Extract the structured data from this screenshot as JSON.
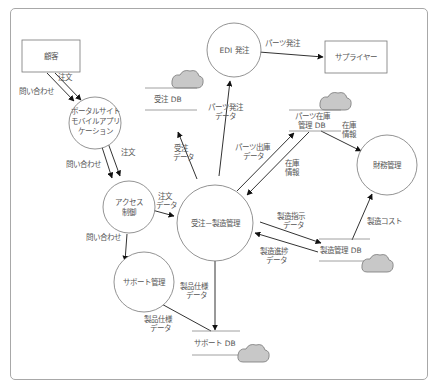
{
  "diagram": {
    "type": "data-flow-diagram",
    "colors": {
      "line": "#333333",
      "node_border": "#777777",
      "cloud_fill": "#c8c8c8",
      "frame": "#a8a8a8",
      "text": "#555555"
    },
    "externals": [
      {
        "id": "customer",
        "label": "顧客"
      },
      {
        "id": "supplier",
        "label": "サプライヤー"
      }
    ],
    "processes": [
      {
        "id": "portal",
        "lines": [
          "ポータルサイト",
          "モバイルアプリ",
          "ケーション"
        ]
      },
      {
        "id": "access",
        "lines": [
          "アクセス",
          "制御"
        ]
      },
      {
        "id": "edi",
        "lines": [
          "EDI 発注"
        ]
      },
      {
        "id": "order_mfg",
        "lines": [
          "受注－製造管理"
        ]
      },
      {
        "id": "finance",
        "lines": [
          "財務管理"
        ]
      },
      {
        "id": "support",
        "lines": [
          "サポート管理"
        ]
      }
    ],
    "stores": [
      {
        "id": "order_db",
        "lines": [
          "受注 DB"
        ]
      },
      {
        "id": "parts_db",
        "lines": [
          "パーツ在庫",
          "管理 DB"
        ]
      },
      {
        "id": "mfg_db",
        "lines": [
          "製造管理 DB"
        ]
      },
      {
        "id": "support_db",
        "lines": [
          "サポート DB"
        ]
      }
    ],
    "flows": [
      {
        "from": "customer",
        "to": "portal",
        "label": [
          "注文"
        ]
      },
      {
        "from": "customer",
        "to": "portal",
        "label": [
          "問い合わせ"
        ]
      },
      {
        "from": "portal",
        "to": "access",
        "label": [
          "注文"
        ]
      },
      {
        "from": "portal",
        "to": "access",
        "label": [
          "問い合わせ"
        ]
      },
      {
        "from": "access",
        "to": "order_mfg",
        "label": [
          "注文",
          "データ"
        ]
      },
      {
        "from": "access",
        "to": "support",
        "label": [
          "問い合わせ"
        ]
      },
      {
        "from": "order_mfg",
        "to": "order_db",
        "label": [
          "受注",
          "データ"
        ]
      },
      {
        "from": "order_mfg",
        "to": "edi",
        "label": [
          "パーツ発注",
          "データ"
        ]
      },
      {
        "from": "edi",
        "to": "supplier",
        "label": [
          "パーツ発注"
        ]
      },
      {
        "from": "order_mfg",
        "to": "parts_db",
        "label": [
          "パーツ出庫",
          "データ"
        ]
      },
      {
        "from": "parts_db",
        "to": "order_mfg",
        "label": [
          "在庫",
          "情報"
        ]
      },
      {
        "from": "parts_db",
        "to": "finance",
        "label": [
          "在庫",
          "情報"
        ]
      },
      {
        "from": "order_mfg",
        "to": "mfg_db",
        "label": [
          "製造指示",
          "データ"
        ]
      },
      {
        "from": "mfg_db",
        "to": "order_mfg",
        "label": [
          "製造進捗",
          "データ"
        ]
      },
      {
        "from": "mfg_db",
        "to": "finance",
        "label": [
          "製造コスト"
        ]
      },
      {
        "from": "order_mfg",
        "to": "support_db",
        "label": [
          "製品仕様",
          "データ"
        ]
      },
      {
        "from": "support_db",
        "to": "support",
        "label": [
          "製品仕様",
          "データ"
        ]
      }
    ]
  }
}
